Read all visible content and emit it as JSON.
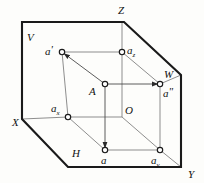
{
  "figure": {
    "stroke_colors": {
      "outer_boundary": "#1a1a1a",
      "inner_construction": "#6d6d6d",
      "node_stroke": "#1a1a1a",
      "node_fill": "#ffffff",
      "background": "#fdfdfb"
    }
  },
  "axes": [
    {
      "name": "axis-label-x",
      "text": "X",
      "x": 12,
      "y": 122
    },
    {
      "name": "axis-label-y",
      "text": "Y",
      "x": 190,
      "y": 175
    },
    {
      "name": "axis-label-z",
      "text": "Z",
      "x": 121,
      "y": 14
    },
    {
      "name": "axis-label-w",
      "text": "W",
      "x": 166,
      "y": 74
    }
  ],
  "planes": [
    {
      "name": "plane-label-v",
      "text": "V",
      "x": 28,
      "y": 40
    },
    {
      "name": "plane-label-h",
      "text": "H",
      "x": 73,
      "y": 156
    }
  ],
  "origin": {
    "name": "origin-label-o",
    "text": "O",
    "x": 125,
    "y": 114
  },
  "points": [
    {
      "id": "a-prime",
      "label": "a",
      "sub": "",
      "prime": "'",
      "cx": 62,
      "cy": 52,
      "label_x": 46,
      "label_y": 51,
      "marked": true,
      "description": "frontal projection on V plane"
    },
    {
      "id": "a-z",
      "label": "a",
      "sub": "z",
      "prime": "",
      "cx": 122,
      "cy": 52,
      "label_x": 127,
      "label_y": 51,
      "marked": true,
      "description": "projection on Z axis"
    },
    {
      "id": "a-point",
      "label": "A",
      "sub": "",
      "prime": "",
      "cx": 105,
      "cy": 84,
      "label_x": 91,
      "label_y": 93,
      "marked": true,
      "description": "space point A"
    },
    {
      "id": "a-double-prime",
      "label": "a",
      "sub": "",
      "prime": "\"",
      "cx": 160,
      "cy": 84,
      "label_x": 163,
      "label_y": 96,
      "marked": true,
      "description": "profile projection on W plane"
    },
    {
      "id": "a-x",
      "label": "a",
      "sub": "x",
      "prime": "",
      "cx": 68,
      "cy": 117,
      "label_x": 52,
      "label_y": 110,
      "marked": true,
      "description": "projection on X axis"
    },
    {
      "id": "a-horizontal",
      "label": "a",
      "sub": "",
      "prime": "",
      "cx": 105,
      "cy": 150,
      "label_x": 101,
      "label_y": 163,
      "marked": true,
      "description": "horizontal projection on H plane"
    },
    {
      "id": "a-y",
      "label": "a",
      "sub": "y",
      "prime": "",
      "cx": 160,
      "cy": 150,
      "label_x": 152,
      "label_y": 163,
      "marked": true,
      "description": "projection on Y axis"
    }
  ],
  "outer_boundary": {
    "name": "projection-planes-outline",
    "points": "22,22 124,22 181,75 181,167 68,167 22,119"
  },
  "inner_lines": [
    {
      "name": "line-aprime-to-az",
      "x1": 62,
      "y1": 52,
      "x2": 122,
      "y2": 52
    },
    {
      "name": "line-aprime-to-ax",
      "x1": 62,
      "y1": 52,
      "x2": 68,
      "y2": 117
    },
    {
      "name": "line-az-to-o",
      "x1": 122,
      "y1": 52,
      "x2": 122,
      "y2": 117
    },
    {
      "name": "line-ax-to-o",
      "x1": 68,
      "y1": 117,
      "x2": 122,
      "y2": 117
    },
    {
      "name": "line-ax-to-a",
      "x1": 68,
      "y1": 117,
      "x2": 105,
      "y2": 150
    },
    {
      "name": "line-a-to-ay",
      "x1": 105,
      "y1": 150,
      "x2": 160,
      "y2": 150
    },
    {
      "name": "line-ay-to-adoubleprime",
      "x1": 160,
      "y1": 150,
      "x2": 160,
      "y2": 84
    },
    {
      "name": "line-adoubleprime-to-az",
      "x1": 160,
      "y1": 84,
      "x2": 122,
      "y2": 52
    },
    {
      "name": "line-o-to-ay",
      "x1": 122,
      "y1": 117,
      "x2": 160,
      "y2": 150
    },
    {
      "name": "line-a-to-aprime-diagonal",
      "x1": 105,
      "y1": 84,
      "x2": 62,
      "y2": 52
    },
    {
      "name": "line-a-to-adoubleprime",
      "x1": 105,
      "y1": 84,
      "x2": 160,
      "y2": 84
    },
    {
      "name": "line-a-to-ah",
      "x1": 105,
      "y1": 84,
      "x2": 105,
      "y2": 150
    },
    {
      "name": "line-aprime-upper-to-az-top",
      "x1": 122,
      "y1": 22,
      "x2": 122,
      "y2": 52
    },
    {
      "name": "line-o-to-w-corner",
      "x1": 122,
      "y1": 117,
      "x2": 181,
      "y2": 167
    },
    {
      "name": "line-ax-left-to-x",
      "x1": 22,
      "y1": 119,
      "x2": 68,
      "y2": 117
    },
    {
      "name": "line-adoubleprime-to-wedge",
      "x1": 160,
      "y1": 84,
      "x2": 181,
      "y2": 75
    }
  ],
  "arrows": [
    {
      "name": "arrow-a-to-aprime",
      "direction": "up-left",
      "tip_x": 81,
      "tip_y": 66
    },
    {
      "name": "arrow-a-to-adoubleprime",
      "direction": "right",
      "tip_x": 133,
      "tip_y": 84
    },
    {
      "name": "arrow-a-to-ah",
      "direction": "down",
      "tip_x": 105,
      "tip_y": 122
    }
  ]
}
